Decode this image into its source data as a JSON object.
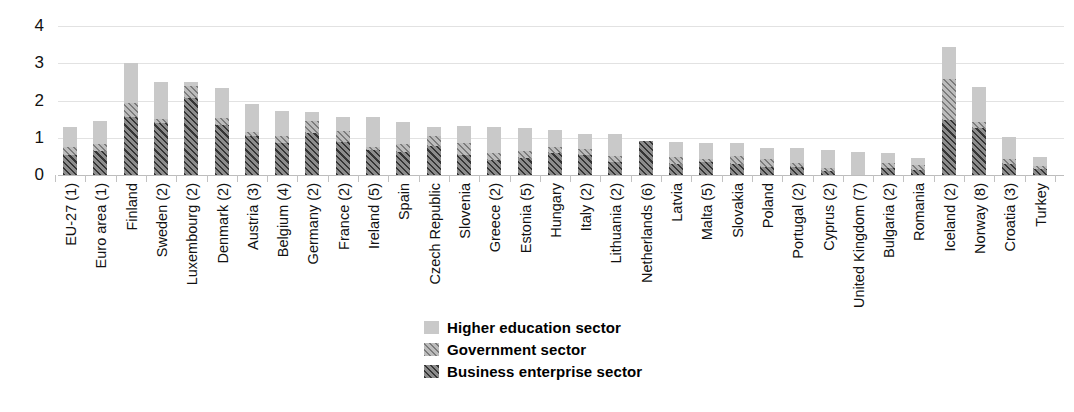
{
  "chart_data": {
    "type": "bar",
    "subtype": "stacked-vertical",
    "title": "",
    "subtitle": "",
    "xlabel": "",
    "ylabel": "",
    "ylim": [
      0,
      4
    ],
    "yticks": [
      0,
      1,
      2,
      3,
      4
    ],
    "ytick_labels": [
      "0",
      "1",
      "2",
      "3",
      "4"
    ],
    "grid": true,
    "grid_axis": "y",
    "legend_position": "bottom-center",
    "stack_order_bottom_to_top": [
      "Business enterprise sector",
      "Government sector",
      "Higher education sector"
    ],
    "categories": [
      "EU-27 (1)",
      "Euro area (1)",
      "Finland",
      "Sweden (2)",
      "Luxembourg (2)",
      "Denmark (2)",
      "Austria (3)",
      "Belgium (4)",
      "Germany (2)",
      "France (2)",
      "Ireland (5)",
      "Spain",
      "Czech Republic",
      "Slovenia",
      "Greece (2)",
      "Estonia (5)",
      "Hungary",
      "Italy (2)",
      "Lithuania (2)",
      "Netherlands (6)",
      "Latvia",
      "Malta (5)",
      "Slovakia",
      "Poland",
      "Portugal (2)",
      "Cyprus (2)",
      "United Kingdom (7)",
      "Bulgaria (2)",
      "Romania",
      "Iceland (2)",
      "Norway (8)",
      "Croatia (3)",
      "Turkey"
    ],
    "series": [
      {
        "name": "Business enterprise sector",
        "color": "#8c8c8c",
        "pattern": "diagonal-hatch-dark",
        "values": [
          0.55,
          0.65,
          1.55,
          1.4,
          2.07,
          1.35,
          1.05,
          0.87,
          1.14,
          0.88,
          0.68,
          0.61,
          0.78,
          0.54,
          0.41,
          0.45,
          0.58,
          0.54,
          0.35,
          0.9,
          0.3,
          0.35,
          0.3,
          0.22,
          0.21,
          0.12,
          0.0,
          0.18,
          0.14,
          1.48,
          1.25,
          0.3,
          0.15
        ]
      },
      {
        "name": "Government sector",
        "color": "#bcbcbc",
        "pattern": "diagonal-hatch-light",
        "values": [
          0.19,
          0.19,
          0.38,
          0.11,
          0.31,
          0.19,
          0.1,
          0.17,
          0.32,
          0.31,
          0.08,
          0.21,
          0.26,
          0.32,
          0.18,
          0.19,
          0.18,
          0.15,
          0.16,
          0.0,
          0.18,
          0.08,
          0.2,
          0.22,
          0.11,
          0.07,
          0.0,
          0.14,
          0.13,
          1.1,
          0.17,
          0.13,
          0.1
        ]
      },
      {
        "name": "Higher education sector",
        "color": "#c9c9c9",
        "pattern": "solid",
        "values": [
          0.56,
          0.62,
          1.07,
          1.0,
          0.12,
          0.79,
          0.75,
          0.68,
          0.22,
          0.36,
          0.79,
          0.6,
          0.25,
          0.46,
          0.69,
          0.63,
          0.46,
          0.42,
          0.6,
          0.0,
          0.41,
          0.44,
          0.37,
          0.29,
          0.4,
          0.47,
          0.62,
          0.28,
          0.18,
          0.85,
          0.94,
          0.59,
          0.24
        ]
      }
    ],
    "totals": [
      1.3,
      1.46,
      3.0,
      2.51,
      2.5,
      2.33,
      1.9,
      1.72,
      1.68,
      1.55,
      1.55,
      1.42,
      1.29,
      1.32,
      1.28,
      1.27,
      1.22,
      1.11,
      1.11,
      0.9,
      0.89,
      0.87,
      0.87,
      0.73,
      0.72,
      0.66,
      0.62,
      0.6,
      0.45,
      3.43,
      2.36,
      1.02,
      0.49
    ]
  },
  "legend": {
    "items": [
      {
        "label": "Higher education sector",
        "swatch": "higher-education-swatch"
      },
      {
        "label": "Government sector",
        "swatch": "government-swatch"
      },
      {
        "label": "Business enterprise sector",
        "swatch": "business-enterprise-swatch"
      }
    ]
  },
  "colors": {
    "higher_education": "#c9c9c9",
    "government": "#bcbcbc",
    "business_enterprise": "#8c8c8c",
    "gridline": "#e2e2e2",
    "text": "#111111",
    "background": "#ffffff"
  }
}
